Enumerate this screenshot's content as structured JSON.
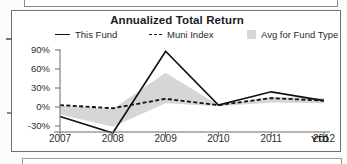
{
  "chart_data": {
    "type": "line",
    "title": "Annualized Total Return",
    "xlabel": "",
    "ylabel": "",
    "x": [
      "2007",
      "2008",
      "2009",
      "2010",
      "2011",
      "2012"
    ],
    "xtick_labels": [
      "2007",
      "2008",
      "2009",
      "2010",
      "2011",
      "2012"
    ],
    "x_suffix_label": "YTD",
    "ytick_labels": [
      "90%",
      "60%",
      "30%",
      "0%",
      "-30%"
    ],
    "ytick_values": [
      90,
      60,
      30,
      0,
      -30
    ],
    "ylim": [
      -45,
      95
    ],
    "grid": false,
    "legend_position": "top",
    "series": [
      {
        "name": "This Fund",
        "style": "solid",
        "color": "#111111",
        "values": [
          -15,
          -41,
          88,
          3,
          24,
          10
        ]
      },
      {
        "name": "Muni Index",
        "style": "dashed",
        "color": "#111111",
        "values": [
          3,
          -2,
          13,
          3,
          14,
          10
        ]
      },
      {
        "name": "Avg for Fund Type",
        "style": "band",
        "color": "#d6d6d6",
        "band_upper": [
          2,
          -3,
          54,
          3,
          16,
          14
        ],
        "band_lower": [
          -12,
          -31,
          6,
          1,
          7,
          6
        ]
      }
    ]
  },
  "chart": {
    "title": "Annualized Total Return",
    "legend": [
      {
        "label": "This Fund",
        "marker": "solid-line-swatch"
      },
      {
        "label": "Muni Index",
        "marker": "dashed-line-swatch"
      },
      {
        "label": "Avg for Fund Type",
        "marker": "gray-box-swatch"
      }
    ],
    "y_axis": {
      "ticks": [
        "90%",
        "60%",
        "30%",
        "0%",
        "-30%"
      ]
    },
    "x_axis": {
      "ticks": [
        "2007",
        "2008",
        "2009",
        "2010",
        "2011",
        "2012"
      ],
      "suffix": "YTD"
    }
  }
}
